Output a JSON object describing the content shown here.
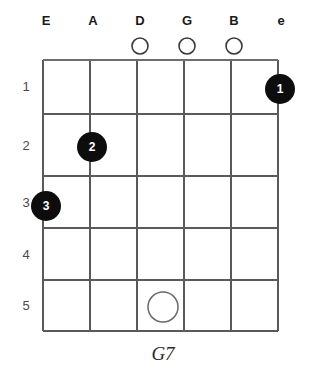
{
  "diagram": {
    "chord_name": "G7",
    "type": "guitar-chord-diagram",
    "string_labels": [
      "E",
      "A",
      "D",
      "G",
      "B",
      "e"
    ],
    "fret_numbers": [
      "1",
      "2",
      "3",
      "4",
      "5"
    ],
    "open_strings": [
      {
        "string_index": 2,
        "marker": "O"
      },
      {
        "string_index": 3,
        "marker": "O"
      },
      {
        "string_index": 4,
        "marker": "O"
      }
    ],
    "finger_dots": [
      {
        "label": "1",
        "string_index": 5,
        "fret": 1,
        "filled": true
      },
      {
        "label": "2",
        "string_index": 1,
        "fret": 2,
        "filled": true
      },
      {
        "label": "3",
        "string_index": 0,
        "fret": 3,
        "filled": true
      }
    ],
    "hollow_dots": [
      {
        "label": "",
        "string_index": 2,
        "fret": 5,
        "filled": false
      }
    ],
    "colors": {
      "dot_fill": "#0d0d0d",
      "dot_text": "#ffffff",
      "grid": "#5a5a5a",
      "nut": "#6e6e6e",
      "label": "#1a1a1a",
      "fret_number": "#4a4a4a",
      "hollow_stroke": "#6a6a6a",
      "background": "#ffffff"
    }
  }
}
